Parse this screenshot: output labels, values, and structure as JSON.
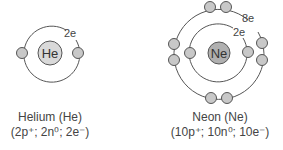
{
  "atoms": [
    {
      "symbol": "He",
      "shell_label": "2e",
      "name": "Helium (He)",
      "composition": "(2p⁺; 2n⁰; 2e⁻)"
    },
    {
      "symbol": "Ne",
      "inner_shell_label": "2e",
      "outer_shell_label": "8e",
      "name": "Neon (Ne)",
      "composition": "(10p⁺; 10n⁰; 10e⁻)"
    }
  ],
  "colors": {
    "he_nucleus": "#d9d9d9",
    "ne_nucleus": "#b0b0b0",
    "electron": "#c8c8c8",
    "stroke": "#555555"
  }
}
